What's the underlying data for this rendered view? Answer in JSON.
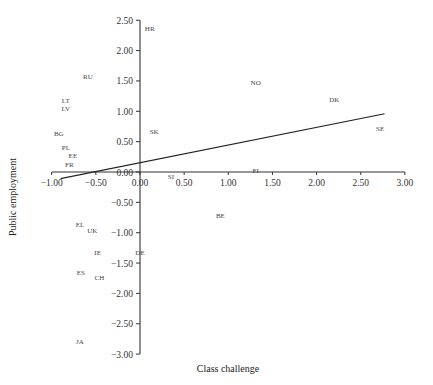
{
  "chart_data": {
    "type": "scatter",
    "title": "",
    "xlabel": "Class challenge",
    "ylabel": "Public employment",
    "xlim": [
      -1.0,
      3.0
    ],
    "ylim": [
      -3.0,
      2.5
    ],
    "grid": false,
    "legend": null,
    "x_ticks": [
      "-1.00",
      "-0.50",
      "0.00",
      "0.50",
      "1.00",
      "1.50",
      "2.00",
      "2.50",
      "3.00"
    ],
    "y_ticks": [
      "2.50",
      "2.00",
      "1.50",
      "1.00",
      "0.50",
      "0.00",
      "-0.50",
      "-1.00",
      "-1.50",
      "-2.00",
      "-2.50",
      "-3.00"
    ],
    "points": [
      {
        "label": "HR",
        "x": 0.11,
        "y": 2.36
      },
      {
        "label": "RU",
        "x": -0.59,
        "y": 1.58
      },
      {
        "label": "LT",
        "x": -0.84,
        "y": 1.17
      },
      {
        "label": "LV",
        "x": -0.84,
        "y": 1.05
      },
      {
        "label": "BG",
        "x": -0.92,
        "y": 0.64
      },
      {
        "label": "PL",
        "x": -0.84,
        "y": 0.41
      },
      {
        "label": "EE",
        "x": -0.76,
        "y": 0.28
      },
      {
        "label": "FR",
        "x": -0.8,
        "y": 0.13
      },
      {
        "label": "SK",
        "x": 0.16,
        "y": 0.66
      },
      {
        "label": "NO",
        "x": 1.31,
        "y": 1.48
      },
      {
        "label": "DK",
        "x": 2.2,
        "y": 1.19
      },
      {
        "label": "SE",
        "x": 2.72,
        "y": 0.72
      },
      {
        "label": "FI",
        "x": 1.31,
        "y": 0.02
      },
      {
        "label": "SI",
        "x": 0.35,
        "y": -0.08
      },
      {
        "label": "BE",
        "x": 0.91,
        "y": -0.71
      },
      {
        "label": "EL",
        "x": -0.68,
        "y": -0.87
      },
      {
        "label": "UK",
        "x": -0.54,
        "y": -0.96
      },
      {
        "label": "IE",
        "x": -0.48,
        "y": -1.32
      },
      {
        "label": "DE",
        "x": 0.0,
        "y": -1.33
      },
      {
        "label": "ES",
        "x": -0.67,
        "y": -1.66
      },
      {
        "label": "CH",
        "x": -0.46,
        "y": -1.73
      },
      {
        "label": "JA",
        "x": -0.68,
        "y": -2.8
      }
    ],
    "regression_line": {
      "x": [
        -0.9,
        2.77
      ],
      "y": [
        -0.11,
        0.96
      ]
    }
  },
  "layout": {
    "origin_px": [
      140,
      172
    ],
    "x_px_per_unit": 88.3,
    "y_px_per_unit": 60.7,
    "axis_color": "#333333",
    "line_color": "#222222",
    "text_color": "#444444"
  }
}
